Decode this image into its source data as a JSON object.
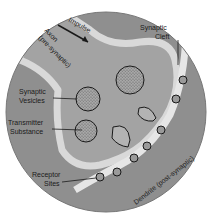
{
  "diagram": {
    "labels": {
      "impulse": "Impulse",
      "axon": "Axon",
      "axon_sub": "(pre-synaptic)",
      "synaptic_cleft_1": "Synaptic",
      "synaptic_cleft_2": "Cleft",
      "vesicles_1": "Synaptic",
      "vesicles_2": "Vesicles",
      "transmitter_1": "Transmitter",
      "transmitter_2": "Substance",
      "receptor_1": "Receptor",
      "receptor_2": "Sites",
      "dendrite": "Dendrite (post-synaptic)"
    },
    "colors": {
      "background": "#ffffff",
      "dendrite_fill": "#8f8f8f",
      "axon_fill": "#a3a3a3",
      "membrane_highlight": "#d9d9d9",
      "cleft": "#e6e6e6",
      "vesicle_fill": "#9a9a9a",
      "outline": "#1a1a1a"
    }
  }
}
